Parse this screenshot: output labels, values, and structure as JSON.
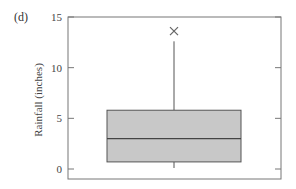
{
  "panel_label": "(d)",
  "chart_data": {
    "type": "box",
    "title": "",
    "xlabel": "",
    "ylabel": "Rainfall (inches)",
    "ylim": [
      0,
      15
    ],
    "yticks": [
      0,
      5,
      10,
      15
    ],
    "ytick_labels": [
      "0",
      "5",
      "10",
      "15"
    ],
    "grid": false,
    "legend": null,
    "box": {
      "whisker_low": 0.1,
      "q1": 0.7,
      "median": 3.0,
      "q3": 5.8,
      "whisker_high": 12.6,
      "outliers": [
        13.6
      ]
    },
    "colors": {
      "box_fill": "#c8c8c8",
      "line": "#555555",
      "outlier": "#666666"
    }
  }
}
